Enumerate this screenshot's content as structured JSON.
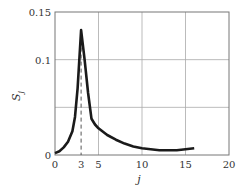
{
  "chart_data": {
    "type": "line",
    "title": "",
    "xlabel": "j",
    "ylabel": "S_j",
    "xlim": [
      0,
      20
    ],
    "ylim": [
      0,
      0.15
    ],
    "grid": true,
    "legend": null,
    "x_ticks": [
      "0",
      "3",
      "5",
      "10",
      "15",
      "20"
    ],
    "y_ticks": [
      "0",
      "0.1",
      "0.15"
    ],
    "annotations": [
      {
        "type": "dashed-vertical-line",
        "x": 3,
        "label": "3"
      }
    ],
    "series": [
      {
        "name": "S_j",
        "x": [
          0,
          0.5,
          1,
          1.5,
          2,
          2.3,
          2.6,
          3,
          3.4,
          3.8,
          4.2,
          4.6,
          5,
          6,
          7,
          8,
          9,
          10,
          11,
          12,
          13,
          14,
          15,
          16
        ],
        "values": [
          0.002,
          0.004,
          0.008,
          0.014,
          0.025,
          0.04,
          0.07,
          0.131,
          0.1,
          0.065,
          0.038,
          0.032,
          0.028,
          0.021,
          0.016,
          0.012,
          0.009,
          0.007,
          0.006,
          0.005,
          0.005,
          0.005,
          0.006,
          0.007
        ]
      }
    ]
  },
  "labels": {
    "x_axis": "j",
    "y_axis_main": "S",
    "y_axis_sub": "j",
    "x_ticks": [
      "0",
      "3",
      "5",
      "10",
      "15",
      "20"
    ],
    "y_ticks": [
      "0",
      "0.1",
      "0.15"
    ]
  }
}
